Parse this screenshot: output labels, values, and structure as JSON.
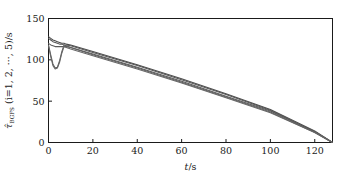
{
  "figure": {
    "background_color": "#ffffff",
    "frame_color": "#1a1a1a",
    "curve_color": "#4d4d4d"
  },
  "chart_data": {
    "type": "line",
    "title": "",
    "subtitle": "",
    "xlabel": "t/s",
    "ylabel": "τ̂_BGFS (i=1, 2, ···, 5)/s",
    "ylabel_parts": {
      "symbol": "τ̂",
      "subscript": "BGFS",
      "paren": "(i=1, 2, ···, 5)",
      "unit": "/s"
    },
    "xlim": [
      0,
      128
    ],
    "ylim": [
      0,
      150
    ],
    "xticks": [
      0,
      20,
      40,
      60,
      80,
      100,
      120
    ],
    "xtick_labels": [
      "0",
      "20",
      "40",
      "60",
      "80",
      "100",
      "120"
    ],
    "yticks": [
      0,
      50,
      100,
      150
    ],
    "ytick_labels": [
      "0",
      "50",
      "100",
      "150"
    ],
    "grid": false,
    "legend": null,
    "legend_position": "none",
    "series": [
      {
        "name": "i=1",
        "color": "#4d4d4d",
        "x": [
          0,
          1,
          2,
          3,
          4,
          5,
          6,
          7,
          8,
          10,
          20,
          40,
          60,
          80,
          100,
          120,
          128
        ],
        "values": [
          128,
          126,
          124,
          123,
          122,
          121,
          120,
          120,
          119,
          118,
          110,
          94,
          77,
          59,
          40,
          14,
          0
        ]
      },
      {
        "name": "i=2",
        "color": "#555555",
        "x": [
          0,
          1,
          2,
          3,
          4,
          5,
          6,
          7,
          8,
          10,
          20,
          40,
          60,
          80,
          100,
          120,
          128
        ],
        "values": [
          126,
          124,
          122,
          121,
          120,
          119,
          119,
          118,
          118,
          117,
          109,
          93,
          76,
          58,
          39,
          13,
          0
        ]
      },
      {
        "name": "i=3",
        "color": "#5a5a5a",
        "x": [
          0,
          1,
          2,
          3,
          4,
          5,
          6,
          7,
          8,
          10,
          20,
          40,
          60,
          80,
          100,
          120,
          128
        ],
        "values": [
          120,
          118,
          117,
          116,
          116,
          116,
          116,
          116,
          116,
          115,
          107,
          91,
          74,
          56,
          38,
          13,
          0
        ]
      },
      {
        "name": "i=4",
        "color": "#606060",
        "x": [
          0,
          1,
          2,
          3,
          4,
          5,
          6,
          7,
          8,
          10,
          20,
          40,
          60,
          80,
          100,
          120,
          128
        ],
        "values": [
          118,
          106,
          95,
          90,
          91,
          99,
          110,
          118,
          117,
          115,
          106,
          90,
          73,
          55,
          37,
          12,
          0
        ]
      },
      {
        "name": "i=5",
        "color": "#666666",
        "x": [
          0,
          1,
          2,
          3,
          4,
          5,
          6,
          7,
          8,
          10,
          20,
          40,
          60,
          80,
          100,
          120,
          128
        ],
        "values": [
          117,
          104,
          93,
          89,
          90,
          97,
          108,
          116,
          115,
          113,
          105,
          89,
          72,
          54,
          36,
          12,
          0
        ]
      }
    ]
  }
}
